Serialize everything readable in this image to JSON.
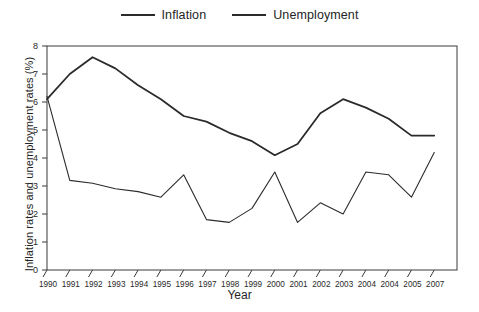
{
  "chart_data": {
    "type": "line",
    "title": "",
    "xlabel": "Year",
    "ylabel": "Inflation rates and unemployment rates (%)",
    "categories": [
      "1990",
      "1991",
      "1992",
      "1993",
      "1994",
      "1995",
      "1996",
      "1997",
      "1998",
      "1999",
      "2000",
      "2001",
      "2002",
      "2003",
      "2004",
      "2004",
      "2005",
      "2007"
    ],
    "ylim": [
      0,
      8
    ],
    "yticks": [
      0,
      1,
      2,
      3,
      4,
      5,
      6,
      7,
      8
    ],
    "grid": false,
    "legend_position": "top-center",
    "series": [
      {
        "name": "Inflation",
        "line_width": "thin",
        "color": "#2b2b2b",
        "values": [
          6.2,
          3.2,
          3.1,
          2.9,
          2.8,
          2.6,
          3.4,
          1.8,
          1.7,
          2.2,
          3.5,
          1.7,
          2.4,
          2.0,
          3.5,
          3.4,
          2.6,
          4.2
        ]
      },
      {
        "name": "Unemployment",
        "line_width": "thick",
        "color": "#2b2b2b",
        "values": [
          6.1,
          7.0,
          7.6,
          7.2,
          6.6,
          6.1,
          5.5,
          5.3,
          4.9,
          4.6,
          4.1,
          4.5,
          5.6,
          6.1,
          5.8,
          5.4,
          4.8,
          4.8
        ]
      }
    ]
  },
  "legend": {
    "items": [
      {
        "label": "Inflation",
        "style": "thin"
      },
      {
        "label": "Unemployment",
        "style": "thick"
      }
    ]
  },
  "axes": {
    "x_title": "Year",
    "y_title": "Inflation rates and unemployment rates (%)"
  }
}
